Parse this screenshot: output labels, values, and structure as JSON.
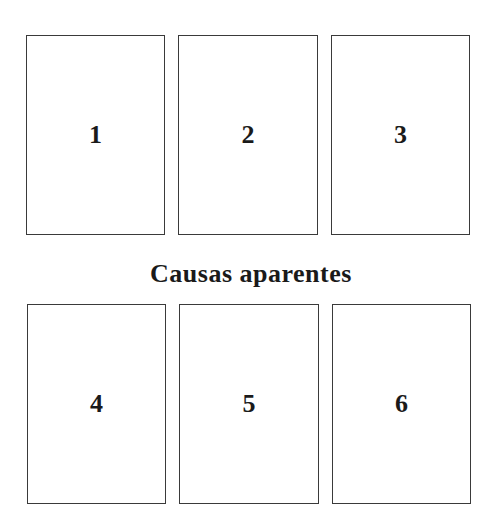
{
  "diagram": {
    "title": "Causas aparentes",
    "top_row": [
      {
        "label": "1"
      },
      {
        "label": "2"
      },
      {
        "label": "3"
      }
    ],
    "bottom_row": [
      {
        "label": "4"
      },
      {
        "label": "5"
      },
      {
        "label": "6"
      }
    ]
  },
  "colors": {
    "border": "#3a3a3a",
    "text": "#1a1a1a",
    "background": "#ffffff"
  }
}
